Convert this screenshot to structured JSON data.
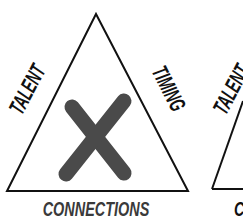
{
  "diagram": {
    "left_triangle": {
      "left_side_label": "TALENT",
      "right_side_label": "TIMING",
      "bottom_label": "CONNECTIONS",
      "center_mark": "X"
    },
    "right_triangle_partial": {
      "left_side_label": "TALENT",
      "bottom_label_partial": "C"
    },
    "colors": {
      "line": "#111111",
      "x_mark": "#4a4a4a",
      "bottom_label": "#3a3a3a",
      "side_labels": "#111111"
    }
  }
}
